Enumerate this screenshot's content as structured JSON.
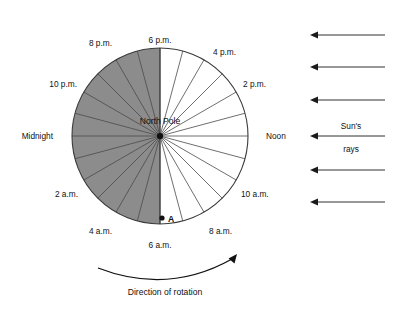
{
  "diagram": {
    "title_center": "North Pole",
    "point_marker": "A",
    "rotation_caption": "Direction of rotation",
    "sun_rays_line1": "Sun's",
    "sun_rays_line2": "rays",
    "colors": {
      "night_fill": "#8c8c8c",
      "day_fill": "#ffffff",
      "outline": "#3a3a3a",
      "spoke": "#4a4a4a",
      "text": "#111111",
      "arrow": "#1a1a1a",
      "background": "#ffffff"
    },
    "geometry": {
      "center_x": 160,
      "center_y": 136,
      "radius": 88,
      "sector_count": 24,
      "sector_degrees": 15
    },
    "hour_labels": [
      {
        "text": "6 p.m.",
        "x": 160,
        "y": 43,
        "anchor": "middle"
      },
      {
        "text": "4 p.m.",
        "x": 213,
        "y": 55,
        "anchor": "start"
      },
      {
        "text": "2 p.m.",
        "x": 243,
        "y": 87,
        "anchor": "start"
      },
      {
        "text": "Noon",
        "x": 266,
        "y": 139,
        "anchor": "start"
      },
      {
        "text": "10 a.m.",
        "x": 241,
        "y": 197,
        "anchor": "start"
      },
      {
        "text": "8 a.m.",
        "x": 209,
        "y": 234,
        "anchor": "start"
      },
      {
        "text": "6 a.m.",
        "x": 160,
        "y": 248,
        "anchor": "middle"
      },
      {
        "text": "4 a.m.",
        "x": 112,
        "y": 234,
        "anchor": "end"
      },
      {
        "text": "2 a.m.",
        "x": 78,
        "y": 197,
        "anchor": "end"
      },
      {
        "text": "Midnight",
        "x": 53,
        "y": 139,
        "anchor": "end"
      },
      {
        "text": "10 p.m.",
        "x": 77,
        "y": 87,
        "anchor": "end"
      },
      {
        "text": "8 p.m.",
        "x": 112,
        "y": 46,
        "anchor": "end"
      }
    ],
    "sun_ray_arrows": [
      {
        "y": 35,
        "x_tail": 385,
        "x_head": 310
      },
      {
        "y": 67,
        "x_tail": 385,
        "x_head": 310
      },
      {
        "y": 100,
        "x_tail": 385,
        "x_head": 310
      },
      {
        "y": 136,
        "x_tail": 385,
        "x_head": 310
      },
      {
        "y": 170,
        "x_tail": 385,
        "x_head": 310
      },
      {
        "y": 202,
        "x_tail": 385,
        "x_head": 310
      }
    ],
    "point_a": {
      "x": 162,
      "y": 218,
      "label_x": 168,
      "label_y": 222
    }
  }
}
